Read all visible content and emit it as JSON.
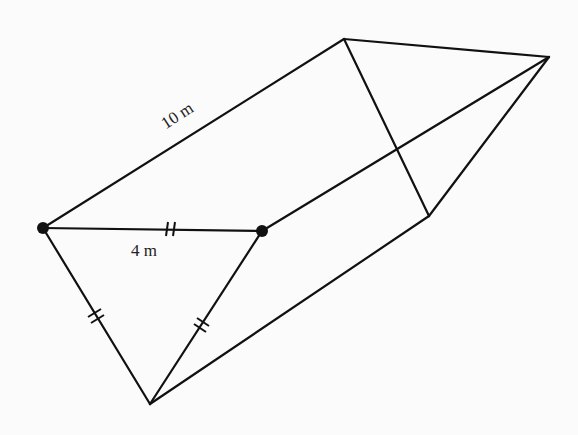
{
  "diagram": {
    "type": "triangular-prism",
    "background_color": "#fbfbfb",
    "line_color": "#111111",
    "labels": {
      "length": "10 m",
      "side": "4 m"
    },
    "vertices": {
      "L": {
        "x": 43,
        "y": 228,
        "marked": true
      },
      "M": {
        "x": 262,
        "y": 231,
        "marked": true
      },
      "B": {
        "x": 150,
        "y": 404,
        "marked": false
      },
      "T": {
        "x": 344,
        "y": 39,
        "marked": false
      },
      "R": {
        "x": 549,
        "y": 57,
        "marked": false
      },
      "V": {
        "x": 429,
        "y": 216,
        "marked": false
      }
    },
    "edges": [
      {
        "from": "L",
        "to": "T",
        "label": "10 m"
      },
      {
        "from": "T",
        "to": "R"
      },
      {
        "from": "T",
        "to": "V"
      },
      {
        "from": "V",
        "to": "R"
      },
      {
        "from": "M",
        "to": "R"
      },
      {
        "from": "B",
        "to": "V"
      },
      {
        "from": "L",
        "to": "M",
        "label": "4 m",
        "equal_marks": 2
      },
      {
        "from": "L",
        "to": "B",
        "equal_marks": 2
      },
      {
        "from": "M",
        "to": "B",
        "equal_marks": 2
      }
    ]
  }
}
